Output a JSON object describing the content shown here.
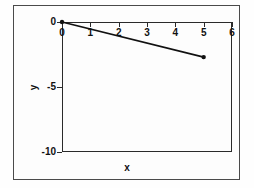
{
  "chart_data": {
    "type": "line",
    "title": "",
    "xlabel": "x",
    "ylabel": "y",
    "xlim": [
      0,
      6
    ],
    "ylim": [
      -10,
      0
    ],
    "xticks": [
      "0",
      "1",
      "2",
      "3",
      "4",
      "5",
      "6"
    ],
    "xtick_values": [
      0,
      1,
      2,
      3,
      4,
      5,
      6
    ],
    "yticks": [
      "0",
      "-5",
      "-10"
    ],
    "ytick_values": [
      0,
      -5,
      -10
    ],
    "grid": false,
    "legend": "none",
    "x_axis_position": "top",
    "series": [
      {
        "name": "line",
        "marker": "filled-circle",
        "color": "#111111",
        "x": [
          0,
          5
        ],
        "values": [
          0,
          -2.7
        ]
      }
    ]
  },
  "figure": {
    "xlabel": "x",
    "ylabel": "y"
  },
  "axis": {
    "x_tick_labels": [
      "0",
      "1",
      "2",
      "3",
      "4",
      "5",
      "6"
    ],
    "y_tick_labels": [
      "0",
      "-5",
      "-10"
    ]
  }
}
